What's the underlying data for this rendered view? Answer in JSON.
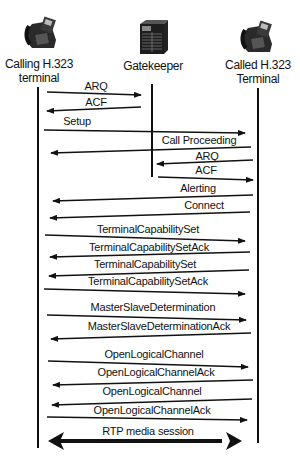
{
  "actors": [
    {
      "id": "caller",
      "label_line1": "Calling H.323",
      "label_line2": "terminal",
      "icon": "phone-icon",
      "x": 38
    },
    {
      "id": "gatekeeper",
      "label_line1": "Gatekeeper",
      "label_line2": "",
      "icon": "server-icon",
      "x": 152
    },
    {
      "id": "callee",
      "label_line1": "Called H.323",
      "label_line2": "Terminal",
      "icon": "phone-icon",
      "x": 258
    }
  ],
  "messages": [
    {
      "label": "ARQ",
      "from": "caller",
      "to": "gatekeeper"
    },
    {
      "label": "ACF",
      "from": "gatekeeper",
      "to": "caller"
    },
    {
      "label": "Setup",
      "from": "caller",
      "to": "callee"
    },
    {
      "label": "Call Proceeding",
      "from": "callee",
      "to": "caller"
    },
    {
      "label": "ARQ",
      "from": "callee",
      "to": "gatekeeper"
    },
    {
      "label": "ACF",
      "from": "gatekeeper",
      "to": "callee"
    },
    {
      "label": "Alerting",
      "from": "callee",
      "to": "caller"
    },
    {
      "label": "Connect",
      "from": "callee",
      "to": "caller"
    },
    {
      "label": "TerminalCapabilitySet",
      "from": "caller",
      "to": "callee"
    },
    {
      "label": "TerminalCapabilitySetAck",
      "from": "callee",
      "to": "caller"
    },
    {
      "label": "TerminalCapabilitySet",
      "from": "callee",
      "to": "caller"
    },
    {
      "label": "TerminalCapabilitySetAck",
      "from": "caller",
      "to": "callee"
    },
    {
      "label": "MasterSlaveDetermination",
      "from": "caller",
      "to": "callee"
    },
    {
      "label": "MasterSlaveDeterminationAck",
      "from": "callee",
      "to": "caller"
    },
    {
      "label": "OpenLogicalChannel",
      "from": "caller",
      "to": "callee"
    },
    {
      "label": "OpenLogicalChannelAck",
      "from": "callee",
      "to": "caller"
    },
    {
      "label": "OpenLogicalChannel",
      "from": "callee",
      "to": "caller"
    },
    {
      "label": "OpenLogicalChannelAck",
      "from": "caller",
      "to": "callee"
    },
    {
      "label": "RTP media session",
      "from": "caller",
      "to": "callee",
      "bidirectional": true
    }
  ],
  "colors": {
    "line": "#111111",
    "background": "#ffffff",
    "text": "#111111"
  }
}
